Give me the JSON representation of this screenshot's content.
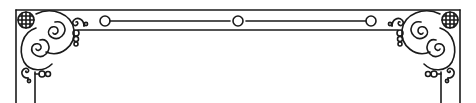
{
  "ornament": {
    "description": "Decorative ornamental border frame with spiral corner flourishes",
    "stroke_color": "#1a1a1a",
    "background_color": "#ffffff",
    "corners": [
      "top-left",
      "top-right"
    ],
    "elements": {
      "top_band": "double horizontal rule with three circle beads",
      "corner_flourish": "crossed globe medallion with interlocking spirals and bead chains",
      "side_band": "double vertical rule descending off-canvas"
    }
  }
}
